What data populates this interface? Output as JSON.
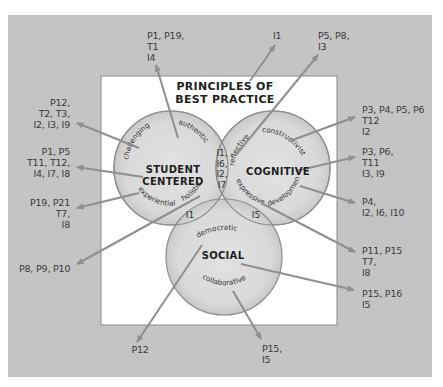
{
  "diagram": {
    "title": "PRINCIPLES OF\nBEST PRACTICE",
    "colors": {
      "outer_background": "#c4c4c4",
      "inner_panel": "#ffffff",
      "circle_fill": "#dadada",
      "circle_stroke": "#8c8c8c",
      "arrow": "#8f8f8f",
      "text": "#3a3a3a"
    },
    "circles": [
      {
        "id": "student-centered",
        "title": "STUDENT\nCENTERED",
        "keywords": [
          "challenging",
          "authentic",
          "experiential",
          "holistic"
        ]
      },
      {
        "id": "cognitive",
        "title": "COGNITIVE",
        "keywords": [
          "reflective",
          "constructivist",
          "expressive",
          "developmental"
        ]
      },
      {
        "id": "social",
        "title": "SOCIAL",
        "keywords": [
          "democratic",
          "collaborative"
        ]
      }
    ],
    "overlaps": {
      "student_cognitive": "I1,\nI6,\nI2,\nI7",
      "student_social": "I1",
      "cognitive_social": "I5"
    },
    "references": {
      "authentic": "P1, P19,\nT1\nI4",
      "reflective": "I1",
      "cognitive_top": "P5, P8,\nI3",
      "challenging": "P12,\nT2, T3,\nI2, I3, I9",
      "student_centered": "P1, P5\nT11, T12,\nI4, I7, I8",
      "experiential": "P19, P21\nT7,\nI8",
      "holistic": "P8, P9, P10",
      "constructivist": "P3, P4, P5, P6\nT12\nI2",
      "cognitive": "P3, P6,\nT11\nI3, I9",
      "developmental": "P4,\nI2, I6, I10",
      "expressive": "P11, P15\nT7,\nI8",
      "social": "P15, P16\nI5",
      "democratic": "P12",
      "collaborative": "P15,\nI5"
    }
  }
}
